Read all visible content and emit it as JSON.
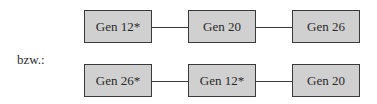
{
  "diagram": {
    "separator_label": "bzw.:",
    "rows": [
      {
        "nodes": [
          "Gen 12*",
          "Gen 20",
          "Gen 26"
        ]
      },
      {
        "nodes": [
          "Gen 26*",
          "Gen 12*",
          "Gen 20"
        ]
      }
    ],
    "colors": {
      "box_fill": "#d0d0d0",
      "border": "#3a3a3a"
    }
  }
}
